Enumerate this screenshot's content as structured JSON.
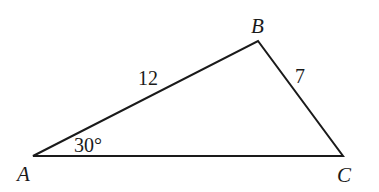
{
  "diagram": {
    "type": "triangle",
    "vertices": [
      {
        "id": "A",
        "label": "A",
        "x": 33,
        "y": 156
      },
      {
        "id": "B",
        "label": "B",
        "x": 258,
        "y": 41
      },
      {
        "id": "C",
        "label": "C",
        "x": 343,
        "y": 156
      }
    ],
    "sides": [
      {
        "id": "AB",
        "label": "12"
      },
      {
        "id": "BC",
        "label": "7"
      },
      {
        "id": "AC",
        "label": ""
      }
    ],
    "angles": [
      {
        "vertex": "A",
        "label": "30°"
      }
    ],
    "stroke_color": "#1a1a1a"
  }
}
